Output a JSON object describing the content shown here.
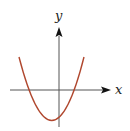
{
  "diagram": {
    "type": "function-graph",
    "axes": {
      "x_label": "x",
      "y_label": "y",
      "color": "#555555"
    },
    "curve": {
      "shape": "parabola",
      "opens": "up",
      "color": "#b0472e",
      "vertex_position": "below x-axis, left of y-axis",
      "x_intercepts": 2,
      "y_intercept": "negative"
    }
  }
}
